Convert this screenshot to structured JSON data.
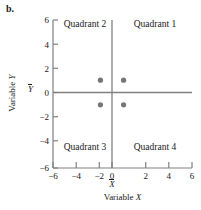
{
  "figure": {
    "panel_label": "b."
  },
  "chart_data": {
    "type": "scatter",
    "title": "",
    "xlabel": "Variable X",
    "ylabel": "Variable Y",
    "xlim": [
      -6,
      6
    ],
    "ylim": [
      -6,
      6
    ],
    "xticks": [
      -6,
      -4,
      -2,
      0,
      2,
      4,
      6
    ],
    "yticks": [
      -6,
      -4,
      -2,
      0,
      2,
      4,
      6
    ],
    "xticklabels": [
      "−6",
      "−4",
      "−2",
      "0",
      "2",
      "4",
      "6"
    ],
    "yticklabels": [
      "−6",
      "−4",
      "−2",
      "0",
      "2",
      "4",
      "6"
    ],
    "grid": false,
    "legend": null,
    "x": [
      -1,
      1,
      -1,
      1
    ],
    "y": [
      1,
      1,
      -1,
      -1
    ],
    "points": [
      {
        "x": -1,
        "y": 1,
        "quadrant": "Quadrant 2"
      },
      {
        "x": 1,
        "y": 1,
        "quadrant": "Quadrant 1"
      },
      {
        "x": -1,
        "y": -1,
        "quadrant": "Quadrant 3"
      },
      {
        "x": 1,
        "y": -1,
        "quadrant": "Quadrant 4"
      }
    ],
    "point_color": "#767676",
    "axis_color": "#808080",
    "reference_lines": [
      {
        "axis": "x",
        "value": 0,
        "label": "X̄"
      },
      {
        "axis": "y",
        "value": 0,
        "label": "Ȳ"
      }
    ],
    "annotations": [
      {
        "text": "Quadrant 2",
        "x": -3.0,
        "y": 5.6
      },
      {
        "text": "Quadrant 1",
        "x": 3.0,
        "y": 5.6
      },
      {
        "text": "Quadrant 3",
        "x": -3.0,
        "y": -4.6
      },
      {
        "text": "Quadrant 4",
        "x": 3.0,
        "y": -4.6
      }
    ],
    "mean_labels": {
      "x_mean": "X̄",
      "y_mean": "Ȳ"
    }
  },
  "axis_titles": {
    "x_prefix": "Variable ",
    "x_variable": "X",
    "y_prefix": "Variable ",
    "y_variable": "Y"
  },
  "quadrant_labels": {
    "q1": "Quadrant 1",
    "q2": "Quadrant 2",
    "q3": "Quadrant 3",
    "q4": "Quadrant 4"
  }
}
